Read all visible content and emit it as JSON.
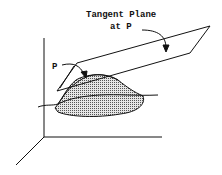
{
  "labels": {
    "plane_line1": "Tangent Plane",
    "plane_line2": "at P",
    "point": "P"
  },
  "colors": {
    "stroke": "#111111",
    "fill": "#bdbdbd",
    "background": "#ffffff"
  }
}
